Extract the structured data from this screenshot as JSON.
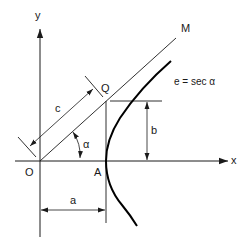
{
  "diagram": {
    "labels": {
      "y_axis": "y",
      "x_axis": "x",
      "origin": "O",
      "vertex": "A",
      "point_q": "Q",
      "line_m": "M",
      "c": "c",
      "b": "b",
      "a": "a",
      "alpha": "α",
      "equation": "e = sec  α"
    },
    "colors": {
      "line": "#1a1a1a",
      "curve": "#000000",
      "background": "#ffffff"
    }
  }
}
